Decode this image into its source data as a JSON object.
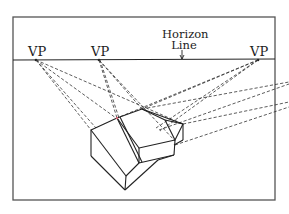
{
  "diagram": {
    "labels": {
      "vp_left": "VP",
      "vp_middle": "VP",
      "vp_right": "VP",
      "horizon_line_1": "Horizon",
      "horizon_line_2": "Line"
    },
    "colors": {
      "ink": "#222222",
      "frame": "#555555",
      "background": "#ffffff",
      "accent_mark": "#d06070"
    },
    "frame": {
      "x": 13,
      "y": 17,
      "width": 262,
      "height": 183
    },
    "horizon_y": 60,
    "vanishing_points": [
      {
        "name": "VP",
        "x": 36,
        "y": 60
      },
      {
        "name": "VP",
        "x": 99,
        "y": 60
      },
      {
        "name": "VP",
        "x": 258,
        "y": 60
      }
    ]
  }
}
